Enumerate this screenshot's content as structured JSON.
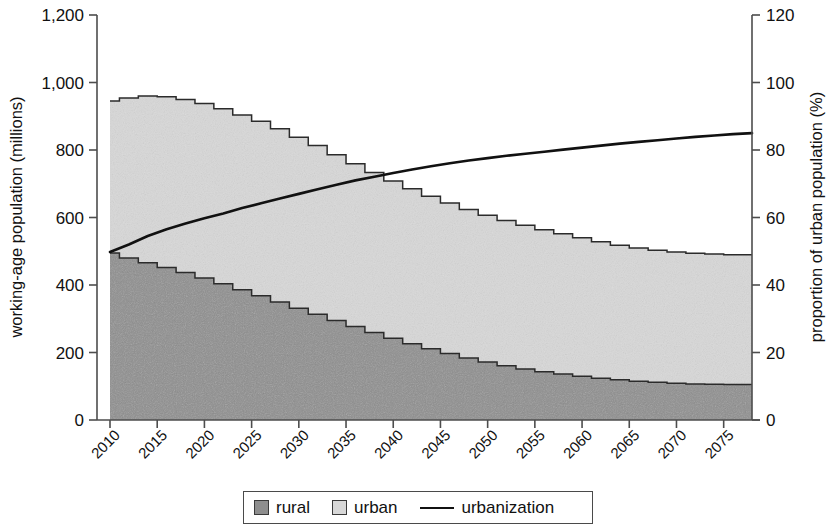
{
  "chart_data": {
    "type": "area",
    "title": "",
    "subtitle": "",
    "xlabel": "",
    "ylabel": "working-age population (millions)",
    "y2label": "proportion of urban population (%)",
    "grid": false,
    "legend_position": "bottom",
    "xlim": [
      2010,
      2078
    ],
    "ylim": [
      0,
      1200
    ],
    "y2lim": [
      0,
      120
    ],
    "x_tick_labels": [
      "2010",
      "2015",
      "2020",
      "2025",
      "2030",
      "2035",
      "2040",
      "2045",
      "2050",
      "2055",
      "2060",
      "2065",
      "2070",
      "2075"
    ],
    "x_ticks": [
      2010,
      2015,
      2020,
      2025,
      2030,
      2035,
      2040,
      2045,
      2050,
      2055,
      2060,
      2065,
      2070,
      2075
    ],
    "y_tick_labels": [
      "0",
      "200",
      "400",
      "600",
      "800",
      "1,000",
      "1,200"
    ],
    "y_ticks": [
      0,
      200,
      400,
      600,
      800,
      1000,
      1200
    ],
    "y2_tick_labels": [
      "0",
      "20",
      "40",
      "60",
      "80",
      "100",
      "120"
    ],
    "y2_ticks": [
      0,
      20,
      40,
      60,
      80,
      100,
      120
    ],
    "x": [
      2010,
      2012,
      2014,
      2016,
      2018,
      2020,
      2022,
      2024,
      2026,
      2028,
      2030,
      2032,
      2034,
      2036,
      2038,
      2040,
      2042,
      2044,
      2046,
      2048,
      2050,
      2052,
      2054,
      2056,
      2058,
      2060,
      2062,
      2064,
      2066,
      2068,
      2070,
      2072,
      2074,
      2076,
      2078
    ],
    "series": [
      {
        "name": "rural",
        "axis": "left",
        "color": "#8e8e8e",
        "values": [
          495,
          480,
          466,
          452,
          437,
          421,
          404,
          386,
          368,
          350,
          331,
          313,
          295,
          277,
          259,
          242,
          226,
          211,
          197,
          184,
          172,
          161,
          151,
          143,
          136,
          130,
          124,
          119,
          115,
          112,
          109,
          107,
          106,
          105,
          105
        ]
      },
      {
        "name": "urban",
        "axis": "left",
        "color": "#d8d8d8",
        "values": [
          450,
          474,
          494,
          506,
          513,
          517,
          518,
          518,
          517,
          513,
          507,
          500,
          491,
          482,
          474,
          466,
          459,
          452,
          446,
          440,
          435,
          430,
          426,
          421,
          416,
          410,
          404,
          399,
          395,
          391,
          389,
          387,
          386,
          385,
          385
        ]
      },
      {
        "name": "urbanization",
        "axis": "right",
        "color": "#111111",
        "values": [
          49.8,
          52.0,
          54.5,
          56.5,
          58.2,
          59.8,
          61.2,
          62.8,
          64.2,
          65.6,
          67.0,
          68.4,
          69.7,
          71.0,
          72.1,
          73.2,
          74.2,
          75.2,
          76.1,
          76.9,
          77.6,
          78.3,
          78.9,
          79.5,
          80.1,
          80.7,
          81.3,
          81.9,
          82.4,
          82.9,
          83.4,
          83.9,
          84.3,
          84.7,
          85.0
        ]
      }
    ],
    "totals": [
      945,
      954,
      960,
      958,
      950,
      938,
      922,
      904,
      885,
      863,
      838,
      813,
      786,
      759,
      733,
      708,
      685,
      663,
      643,
      624,
      607,
      591,
      577,
      564,
      552,
      540,
      528,
      518,
      510,
      503,
      498,
      494,
      492,
      490,
      490
    ]
  },
  "legend": {
    "items": [
      {
        "label": "rural",
        "marker": "square-swatch-dark"
      },
      {
        "label": "urban",
        "marker": "square-swatch-light"
      },
      {
        "label": "urbanization",
        "marker": "line-swatch-black"
      }
    ]
  }
}
